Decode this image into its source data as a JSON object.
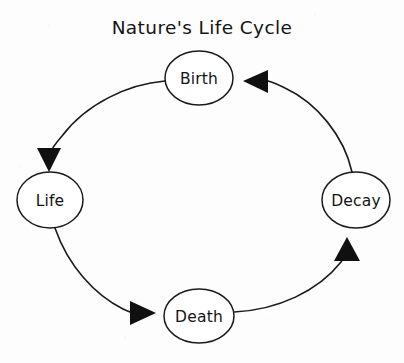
{
  "diagram": {
    "title": "Nature's Life Cycle",
    "type": "cycle-diagram",
    "style": "hand-drawn",
    "background_color": "#fdfdfd",
    "stroke_color": "#1a1a1a",
    "node_fill_color": "#ffffff",
    "arrow_fill_color": "#101010",
    "nodes": [
      {
        "id": "birth",
        "label": "Birth",
        "cx": 199,
        "cy": 78,
        "rx": 34,
        "ry": 27
      },
      {
        "id": "life",
        "label": "Life",
        "cx": 50,
        "cy": 200,
        "rx": 33,
        "ry": 28
      },
      {
        "id": "death",
        "label": "Death",
        "cx": 199,
        "cy": 316,
        "rx": 35,
        "ry": 27
      },
      {
        "id": "decay",
        "label": "Decay",
        "cx": 356,
        "cy": 200,
        "rx": 34,
        "ry": 28
      }
    ],
    "edges": [
      {
        "id": "birth-to-life",
        "from": "Birth",
        "to": "Life",
        "arrow_direction": "down"
      },
      {
        "id": "life-to-death",
        "from": "Life",
        "to": "Death",
        "arrow_direction": "right"
      },
      {
        "id": "death-to-decay",
        "from": "Death",
        "to": "Decay",
        "arrow_direction": "up"
      },
      {
        "id": "decay-to-birth",
        "from": "Decay",
        "to": "Birth",
        "arrow_direction": "left"
      }
    ]
  }
}
